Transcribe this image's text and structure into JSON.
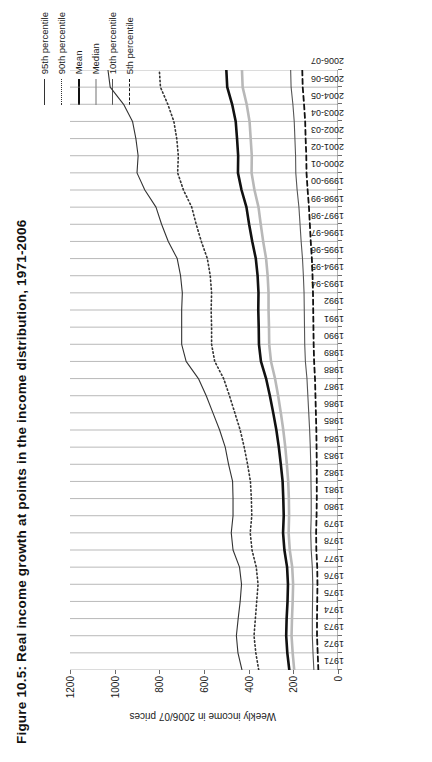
{
  "title": "Figure 10.5: Real income growth at points in the income distribution, 1971-2006",
  "axes": {
    "ylabel": "Weekly income in 2006/07 prices",
    "xlabel": "",
    "yticks": [
      "0",
      "200",
      "400",
      "600",
      "800",
      "1000",
      "1200"
    ]
  },
  "legend": [
    {
      "label": "95th percentile",
      "style": "solid-thin",
      "color": "#333333",
      "width": 1.1
    },
    {
      "label": "90th percentile",
      "style": "dotted",
      "color": "#333333",
      "width": 1.6
    },
    {
      "label": "Mean",
      "style": "solid-thick",
      "color": "#111111",
      "width": 2.6
    },
    {
      "label": "Median",
      "style": "solid-thick",
      "color": "#b8b8b8",
      "width": 2.6
    },
    {
      "label": "10th percentile",
      "style": "solid-thin",
      "color": "#555555",
      "width": 1.1
    },
    {
      "label": "5th percentile",
      "style": "dashed",
      "color": "#111111",
      "width": 1.8
    }
  ],
  "chart_data": {
    "type": "line",
    "title": "Figure 10.5: Real income growth at points in the income distribution, 1971-2006",
    "xlabel": "",
    "ylabel": "Weekly income in 2006/07 prices",
    "ylim": [
      0,
      1200
    ],
    "grid": true,
    "legend_position": "top-right",
    "categories": [
      "1971",
      "1972",
      "1973",
      "1974",
      "1975",
      "1976",
      "1977",
      "1978",
      "1979",
      "1980",
      "1981",
      "1982",
      "1983",
      "1984",
      "1985",
      "1986",
      "1987",
      "1988",
      "1989",
      "1990",
      "1991",
      "1992",
      "1993-94",
      "1994-95",
      "1995-96",
      "1996-97",
      "1997-98",
      "1998-99",
      "1999-00",
      "2000-01",
      "2001-02",
      "2002-03",
      "2003-04",
      "2004-05",
      "2005-06",
      "2006-07"
    ],
    "series": [
      {
        "name": "95th percentile",
        "values": [
          430,
          448,
          455,
          447,
          438,
          432,
          441,
          470,
          478,
          470,
          470,
          472,
          490,
          505,
          530,
          560,
          590,
          625,
          680,
          700,
          700,
          700,
          697,
          705,
          720,
          760,
          790,
          815,
          865,
          900,
          895,
          905,
          920,
          960,
          1020,
          1030
        ]
      },
      {
        "name": "90th percentile",
        "values": [
          355,
          368,
          376,
          370,
          364,
          358,
          366,
          385,
          393,
          386,
          388,
          392,
          405,
          420,
          438,
          462,
          486,
          512,
          552,
          566,
          566,
          568,
          566,
          572,
          585,
          612,
          635,
          655,
          692,
          718,
          715,
          722,
          735,
          762,
          795,
          800
        ]
      },
      {
        "name": "Mean",
        "values": [
          218,
          227,
          232,
          230,
          226,
          224,
          228,
          240,
          246,
          243,
          245,
          248,
          256,
          265,
          276,
          290,
          305,
          322,
          345,
          354,
          355,
          357,
          356,
          360,
          368,
          384,
          398,
          410,
          432,
          448,
          447,
          452,
          458,
          474,
          496,
          500
        ]
      },
      {
        "name": "Median",
        "values": [
          196,
          203,
          208,
          206,
          203,
          201,
          205,
          216,
          221,
          219,
          220,
          223,
          229,
          236,
          245,
          256,
          268,
          282,
          300,
          308,
          309,
          311,
          311,
          315,
          322,
          335,
          346,
          356,
          374,
          387,
          386,
          391,
          396,
          409,
          427,
          430
        ]
      },
      {
        "name": "10th percentile",
        "values": [
          108,
          112,
          115,
          115,
          114,
          113,
          115,
          120,
          122,
          120,
          120,
          121,
          122,
          124,
          127,
          131,
          135,
          139,
          146,
          149,
          150,
          151,
          152,
          155,
          159,
          165,
          170,
          175,
          183,
          189,
          190,
          193,
          196,
          202,
          210,
          212
        ]
      },
      {
        "name": "5th percentile",
        "values": [
          88,
          91,
          94,
          94,
          93,
          92,
          93,
          97,
          98,
          96,
          95,
          95,
          95,
          96,
          97,
          99,
          101,
          103,
          107,
          109,
          110,
          111,
          112,
          114,
          117,
          122,
          126,
          130,
          136,
          141,
          142,
          145,
          147,
          152,
          158,
          160
        ]
      }
    ]
  }
}
